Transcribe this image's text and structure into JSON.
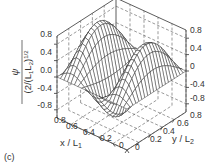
{
  "panel_label": "(c)",
  "chart_data": {
    "type": "surface",
    "title": "",
    "function": "psi / (2/(L1 L2)^(1/2)) as a 3D wireframe surface: one positive central lobe flanked by two negative lobes along x",
    "xlabel": "x / L1",
    "ylabel": "y / L2",
    "zlabel": "psi / (2/(L1 L2)^(1/2))",
    "xlabel_parts": {
      "base": "x / L",
      "sub": "1"
    },
    "ylabel_parts": {
      "base": "y / L",
      "sub": "2"
    },
    "zlabel_parts": {
      "num": "ψ",
      "den_pre": "(2/(L",
      "sub1": "1",
      "mid": "L",
      "sub2": "2",
      "den_post": ")",
      "sup": "1/2"
    },
    "x_ticks": [
      "0",
      "0.2",
      "0.4",
      "0.6",
      "0.8"
    ],
    "y_ticks": [
      "0",
      "0.2",
      "0.4",
      "0.6",
      "0.8"
    ],
    "z_ticks_left": [
      "0.8",
      "0.4",
      "0.0",
      "-0.4",
      "-0.8"
    ],
    "z_ticks_right": [
      "0.8",
      "0.4",
      "0",
      "-0.4",
      "-0.8"
    ],
    "xlim": [
      0,
      1
    ],
    "ylim": [
      0,
      1
    ],
    "zlim": [
      -1,
      1
    ],
    "grid": true,
    "grid_style": "dashed",
    "mesh_resolution": 20,
    "nx": 3,
    "ny": 1,
    "peak_value": 1.0,
    "trough_value": -1.0
  }
}
